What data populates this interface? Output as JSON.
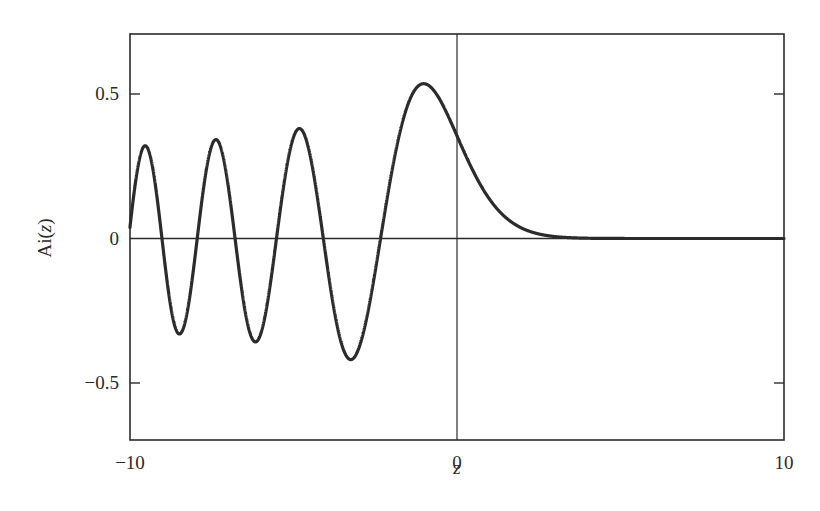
{
  "chart_data": {
    "type": "line",
    "title": "",
    "function": "Ai(z)",
    "xlabel": "z",
    "ylabel": "Ai(z)",
    "ylabel_parts": {
      "prefix": "Ai(",
      "var": "z",
      "suffix": ")"
    },
    "xlim": [
      -10,
      10
    ],
    "ylim": [
      -0.7,
      0.7
    ],
    "x_ticks": [
      -10,
      0,
      10
    ],
    "x_tick_labels": [
      "−10",
      "0",
      "10"
    ],
    "y_ticks": [
      0.5,
      0,
      -0.5
    ],
    "y_tick_labels": [
      "0.5",
      "0",
      "−0.5"
    ],
    "grid": false,
    "legend": null,
    "reference_lines": {
      "x0": true,
      "y0": true
    },
    "line_color": "#2b2b2b",
    "series": [
      {
        "name": "Ai(z)",
        "x": [
          -10,
          -9.5,
          -9.0,
          -8.5,
          -8.0,
          -7.5,
          -7.0,
          -6.5,
          -6.0,
          -5.5,
          -5.0,
          -4.5,
          -4.0,
          -3.5,
          -3.0,
          -2.5,
          -2.0,
          -1.5,
          -1.0,
          -0.5,
          0,
          0.5,
          1.0,
          1.5,
          2.0,
          2.5,
          3.0,
          4.0,
          5.0,
          6.0,
          8.0,
          10.0
        ],
        "values": [
          0.042,
          0.318,
          -0.022,
          -0.308,
          0.053,
          0.315,
          0.184,
          -0.17,
          -0.329,
          -0.086,
          0.351,
          0.292,
          -0.07,
          -0.372,
          -0.379,
          -0.111,
          0.227,
          0.464,
          0.535,
          0.476,
          0.355,
          0.232,
          0.135,
          0.072,
          0.035,
          0.016,
          0.007,
          0.001,
          0.0001,
          0.0,
          0.0,
          0.0
        ]
      }
    ],
    "extrema": [
      {
        "z": -9.4,
        "value": 0.32
      },
      {
        "z": -8.5,
        "value": -0.31
      },
      {
        "z": -7.4,
        "value": 0.34
      },
      {
        "z": -6.2,
        "value": -0.35
      },
      {
        "z": -4.8,
        "value": 0.38
      },
      {
        "z": -3.25,
        "value": -0.42
      },
      {
        "z": -1.02,
        "value": 0.536
      }
    ]
  }
}
